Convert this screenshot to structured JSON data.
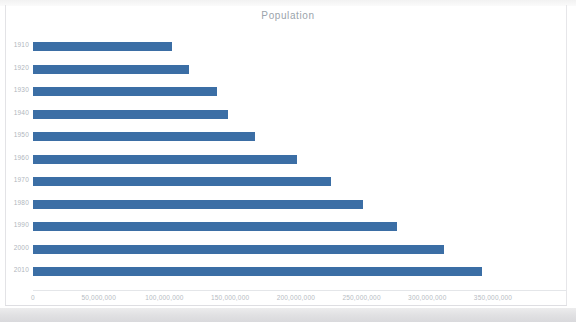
{
  "chart": {
    "title": "Population"
  },
  "chart_data": {
    "type": "bar",
    "orientation": "horizontal",
    "title": "Population",
    "xlabel": "",
    "ylabel": "",
    "categories": [
      "1910",
      "1920",
      "1930",
      "1940",
      "1950",
      "1960",
      "1970",
      "1980",
      "1990",
      "2000",
      "2010"
    ],
    "values": [
      106000000,
      119000000,
      140000000,
      148000000,
      169000000,
      201000000,
      227000000,
      251000000,
      277000000,
      313000000,
      342000000
    ],
    "xlim": [
      0,
      350000000
    ],
    "xticks": [
      0,
      50000000,
      100000000,
      150000000,
      200000000,
      250000000,
      300000000,
      350000000
    ],
    "xtick_labels": [
      "0",
      "50,000,000",
      "100,000,000",
      "150,000,000",
      "200,000,000",
      "250,000,000",
      "300,000,000",
      "350,000,000"
    ],
    "grid": false,
    "legend": false,
    "series": [
      {
        "name": "Population",
        "color": "#3b6ea5",
        "values": [
          106000000,
          119000000,
          140000000,
          148000000,
          169000000,
          201000000,
          227000000,
          251000000,
          277000000,
          313000000,
          342000000
        ]
      }
    ]
  }
}
